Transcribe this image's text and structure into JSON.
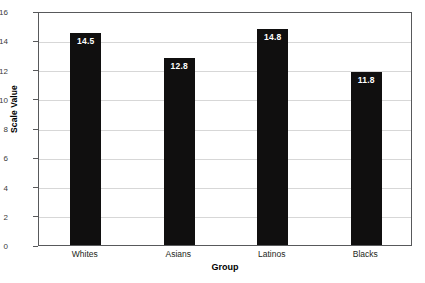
{
  "chart_data": {
    "type": "bar",
    "title": "",
    "xlabel": "Group",
    "ylabel": "Scale Value",
    "categories": [
      "Whites",
      "Asians",
      "Latinos",
      "Blacks"
    ],
    "values": [
      14.5,
      12.8,
      14.8,
      11.8
    ],
    "value_labels": [
      "14.5",
      "12.8",
      "14.8",
      "11.8"
    ],
    "ylim": [
      0,
      16
    ],
    "ytick_labels": [
      "0",
      "2",
      "4",
      "6",
      "8",
      "10",
      "12",
      "14",
      "16"
    ],
    "ytick_values": [
      0,
      2,
      4,
      6,
      8,
      10,
      12,
      14,
      16
    ],
    "grid": true,
    "legend": false,
    "bar_color": "#100f0f",
    "label_color": "#ffffff",
    "grid_color": "#d7d7d7",
    "axis_color": "#58595b",
    "background": "#ffffff"
  }
}
